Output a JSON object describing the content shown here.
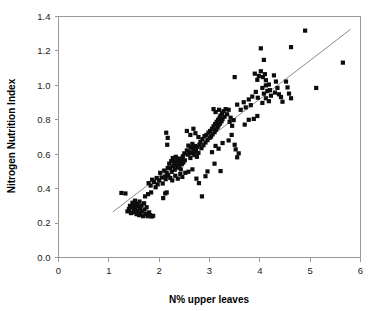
{
  "chart_data": {
    "type": "scatter",
    "title": "",
    "xlabel": "N% upper leaves",
    "ylabel": "Nitrogen Nutrition Index",
    "xlim": [
      0,
      6
    ],
    "ylim": [
      0.0,
      1.4
    ],
    "xticks": [
      "0",
      "1",
      "2",
      "3",
      "4",
      "5",
      "6"
    ],
    "yticks": [
      "0.0",
      "0.2",
      "0.4",
      "0.6",
      "0.8",
      "1.0",
      "1.2",
      "1.4"
    ],
    "xtick_values": [
      0,
      1,
      2,
      3,
      4,
      5,
      6
    ],
    "ytick_values": [
      0.0,
      0.2,
      0.4,
      0.6,
      0.8,
      1.0,
      1.2,
      1.4
    ],
    "grid": false,
    "legend": null,
    "marker_color": "#0d0d0d",
    "marker_shape": "square",
    "marker_size": 2.1,
    "frame_color": "#9a9a9a",
    "trend_line": {
      "name": "linear fit",
      "color": "#8c8c8c",
      "x_start": 1.08,
      "y_start": 0.265,
      "x_end": 5.8,
      "y_end": 1.325
    },
    "series": [
      {
        "name": "observations",
        "points": [
          [
            1.25,
            0.375
          ],
          [
            1.33,
            0.372
          ],
          [
            1.37,
            0.268
          ],
          [
            1.4,
            0.282
          ],
          [
            1.42,
            0.3
          ],
          [
            1.44,
            0.258
          ],
          [
            1.46,
            0.292
          ],
          [
            1.47,
            0.318
          ],
          [
            1.49,
            0.276
          ],
          [
            1.5,
            0.305
          ],
          [
            1.51,
            0.262
          ],
          [
            1.52,
            0.33
          ],
          [
            1.53,
            0.288
          ],
          [
            1.55,
            0.252
          ],
          [
            1.56,
            0.312
          ],
          [
            1.57,
            0.27
          ],
          [
            1.58,
            0.298
          ],
          [
            1.6,
            0.246
          ],
          [
            1.61,
            0.325
          ],
          [
            1.62,
            0.285
          ],
          [
            1.63,
            0.258
          ],
          [
            1.65,
            0.302
          ],
          [
            1.66,
            0.268
          ],
          [
            1.68,
            0.24
          ],
          [
            1.7,
            0.315
          ],
          [
            1.71,
            0.278
          ],
          [
            1.73,
            0.252
          ],
          [
            1.75,
            0.292
          ],
          [
            1.77,
            0.24
          ],
          [
            1.8,
            0.262
          ],
          [
            1.82,
            0.246
          ],
          [
            1.85,
            0.238
          ],
          [
            1.88,
            0.242
          ],
          [
            1.72,
            0.355
          ],
          [
            1.78,
            0.368
          ],
          [
            1.84,
            0.378
          ],
          [
            1.79,
            0.432
          ],
          [
            1.83,
            0.418
          ],
          [
            1.86,
            0.452
          ],
          [
            1.9,
            0.438
          ],
          [
            1.93,
            0.408
          ],
          [
            1.95,
            0.462
          ],
          [
            1.97,
            0.425
          ],
          [
            2.0,
            0.448
          ],
          [
            2.02,
            0.492
          ],
          [
            2.05,
            0.465
          ],
          [
            2.07,
            0.43
          ],
          [
            2.1,
            0.505
          ],
          [
            2.12,
            0.47
          ],
          [
            2.13,
            0.455
          ],
          [
            2.15,
            0.492
          ],
          [
            2.17,
            0.52
          ],
          [
            2.18,
            0.478
          ],
          [
            2.08,
            0.345
          ],
          [
            2.12,
            0.372
          ],
          [
            2.15,
            0.378
          ],
          [
            2.14,
            0.725
          ],
          [
            2.17,
            0.695
          ],
          [
            2.16,
            0.655
          ],
          [
            2.2,
            0.545
          ],
          [
            2.22,
            0.52
          ],
          [
            2.24,
            0.56
          ],
          [
            2.25,
            0.498
          ],
          [
            2.27,
            0.578
          ],
          [
            2.28,
            0.532
          ],
          [
            2.3,
            0.555
          ],
          [
            2.31,
            0.51
          ],
          [
            2.33,
            0.585
          ],
          [
            2.34,
            0.54
          ],
          [
            2.35,
            0.562
          ],
          [
            2.36,
            0.522
          ],
          [
            2.38,
            0.548
          ],
          [
            2.39,
            0.575
          ],
          [
            2.4,
            0.53
          ],
          [
            2.41,
            0.558
          ],
          [
            2.43,
            0.512
          ],
          [
            2.44,
            0.568
          ],
          [
            2.45,
            0.542
          ],
          [
            2.47,
            0.588
          ],
          [
            2.48,
            0.552
          ],
          [
            2.5,
            0.605
          ],
          [
            2.51,
            0.565
          ],
          [
            2.22,
            0.462
          ],
          [
            2.26,
            0.448
          ],
          [
            2.32,
            0.475
          ],
          [
            2.37,
            0.458
          ],
          [
            2.42,
            0.485
          ],
          [
            2.46,
            0.468
          ],
          [
            2.52,
            0.492
          ],
          [
            2.55,
            0.622
          ],
          [
            2.57,
            0.598
          ],
          [
            2.58,
            0.65
          ],
          [
            2.6,
            0.612
          ],
          [
            2.62,
            0.578
          ],
          [
            2.63,
            0.638
          ],
          [
            2.65,
            0.605
          ],
          [
            2.66,
            0.66
          ],
          [
            2.68,
            0.625
          ],
          [
            2.7,
            0.595
          ],
          [
            2.71,
            0.648
          ],
          [
            2.73,
            0.618
          ],
          [
            2.75,
            0.585
          ],
          [
            2.76,
            0.642
          ],
          [
            2.78,
            0.608
          ],
          [
            2.8,
            0.655
          ],
          [
            2.55,
            0.735
          ],
          [
            2.62,
            0.712
          ],
          [
            2.68,
            0.748
          ],
          [
            2.72,
            0.722
          ],
          [
            2.78,
            0.7
          ],
          [
            2.58,
            0.498
          ],
          [
            2.66,
            0.512
          ],
          [
            2.74,
            0.458
          ],
          [
            2.79,
            0.432
          ],
          [
            2.82,
            0.672
          ],
          [
            2.84,
            0.635
          ],
          [
            2.86,
            0.688
          ],
          [
            2.88,
            0.652
          ],
          [
            2.9,
            0.705
          ],
          [
            2.92,
            0.668
          ],
          [
            2.94,
            0.712
          ],
          [
            2.96,
            0.682
          ],
          [
            2.98,
            0.725
          ],
          [
            3.0,
            0.695
          ],
          [
            3.01,
            0.735
          ],
          [
            3.03,
            0.702
          ],
          [
            2.85,
            0.355
          ],
          [
            2.92,
            0.472
          ],
          [
            2.96,
            0.5
          ],
          [
            3.05,
            0.748
          ],
          [
            3.06,
            0.715
          ],
          [
            3.08,
            0.762
          ],
          [
            3.1,
            0.728
          ],
          [
            3.11,
            0.775
          ],
          [
            3.13,
            0.742
          ],
          [
            3.14,
            0.788
          ],
          [
            3.16,
            0.755
          ],
          [
            3.17,
            0.8
          ],
          [
            3.18,
            0.768
          ],
          [
            3.2,
            0.812
          ],
          [
            3.21,
            0.778
          ],
          [
            3.22,
            0.825
          ],
          [
            3.24,
            0.792
          ],
          [
            3.25,
            0.838
          ],
          [
            3.26,
            0.805
          ],
          [
            3.28,
            0.85
          ],
          [
            3.3,
            0.818
          ],
          [
            3.32,
            0.862
          ],
          [
            3.08,
            0.862
          ],
          [
            3.12,
            0.845
          ],
          [
            3.19,
            0.858
          ],
          [
            3.05,
            0.612
          ],
          [
            3.12,
            0.648
          ],
          [
            3.18,
            0.632
          ],
          [
            3.26,
            0.665
          ],
          [
            3.1,
            0.545
          ],
          [
            3.22,
            0.502
          ],
          [
            3.35,
            0.832
          ],
          [
            3.38,
            0.858
          ],
          [
            3.4,
            0.788
          ],
          [
            3.42,
            0.812
          ],
          [
            3.45,
            0.765
          ],
          [
            3.48,
            0.798
          ],
          [
            3.38,
            0.68
          ],
          [
            3.44,
            0.712
          ],
          [
            3.5,
            0.655
          ],
          [
            3.52,
            0.628
          ],
          [
            3.55,
            0.582
          ],
          [
            3.58,
            0.605
          ],
          [
            3.5,
            1.048
          ],
          [
            3.55,
            0.888
          ],
          [
            3.62,
            0.858
          ],
          [
            3.68,
            0.902
          ],
          [
            3.72,
            0.872
          ],
          [
            3.78,
            0.918
          ],
          [
            3.82,
            0.885
          ],
          [
            3.85,
            0.935
          ],
          [
            3.7,
            0.772
          ],
          [
            3.78,
            0.8
          ],
          [
            3.88,
            0.805
          ],
          [
            3.9,
            1.068
          ],
          [
            3.95,
            1.032
          ],
          [
            3.98,
            1.055
          ],
          [
            3.92,
            0.962
          ],
          [
            3.96,
            0.928
          ],
          [
            4.02,
            1.215
          ],
          [
            4.08,
            1.148
          ],
          [
            4.02,
            1.082
          ],
          [
            4.06,
            1.048
          ],
          [
            4.1,
            1.065
          ],
          [
            4.12,
            1.03
          ],
          [
            4.05,
            0.985
          ],
          [
            4.08,
            0.952
          ],
          [
            4.12,
            1.0
          ],
          [
            4.15,
            0.968
          ],
          [
            4.18,
            1.005
          ],
          [
            4.2,
            0.972
          ],
          [
            4.05,
            0.898
          ],
          [
            4.12,
            0.925
          ],
          [
            4.18,
            0.908
          ],
          [
            4.22,
            0.94
          ],
          [
            3.95,
            0.822
          ],
          [
            4.28,
            1.058
          ],
          [
            4.32,
            1.022
          ],
          [
            4.3,
            0.958
          ],
          [
            4.35,
            0.985
          ],
          [
            4.38,
            0.948
          ],
          [
            4.42,
            0.932
          ],
          [
            4.45,
            0.905
          ],
          [
            4.52,
            1.022
          ],
          [
            4.55,
            0.988
          ],
          [
            4.62,
            1.222
          ],
          [
            4.58,
            0.952
          ],
          [
            4.62,
            0.925
          ],
          [
            4.9,
            1.318
          ],
          [
            5.12,
            0.985
          ],
          [
            5.65,
            1.132
          ]
        ]
      }
    ]
  },
  "axes": {
    "x_title": "N% upper leaves",
    "y_title": "Nitrogen Nutrition Index"
  }
}
